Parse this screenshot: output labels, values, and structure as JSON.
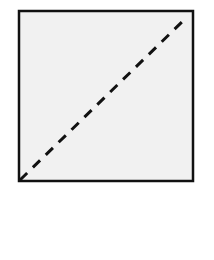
{
  "diagram": {
    "square": {
      "x": 19,
      "y": 11,
      "width": 174,
      "height": 170,
      "fill": "#f1f1f1",
      "stroke": "#111111",
      "stroke_width": 2.5
    },
    "diagonal": {
      "x1": 20,
      "y1": 180,
      "x2": 184,
      "y2": 20,
      "stroke": "#111111",
      "stroke_width": 3,
      "dash": "10 8",
      "style": "dashed"
    }
  }
}
